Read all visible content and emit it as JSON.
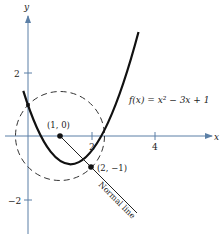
{
  "figure": {
    "function_label": "f(x) = x² − 3x + 1",
    "axes": {
      "x_label": "x",
      "y_label": "y",
      "x_ticks": [
        "2",
        "4"
      ],
      "y_ticks": [
        "2",
        "−2"
      ]
    },
    "points": {
      "center": "(1, 0)",
      "tangent_point": "(2, −1)"
    },
    "normal_line_label": "Normal line",
    "colors": {
      "axis": "#5b7fa6",
      "curve": "#111111",
      "circle": "#333333"
    }
  }
}
